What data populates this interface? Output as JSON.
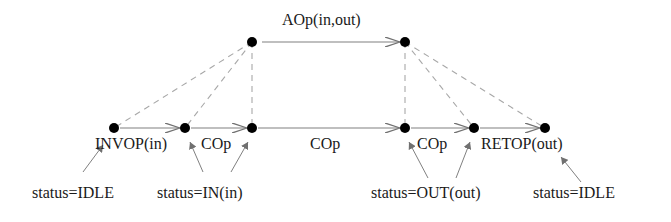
{
  "diagram": {
    "top_nodes": [
      {
        "id": "a1",
        "x": 252,
        "y": 42
      },
      {
        "id": "a2",
        "x": 405,
        "y": 42
      }
    ],
    "bottom_nodes": [
      {
        "id": "b1",
        "x": 114,
        "y": 128
      },
      {
        "id": "b2",
        "x": 185,
        "y": 128
      },
      {
        "id": "b3",
        "x": 252,
        "y": 128
      },
      {
        "id": "b4",
        "x": 405,
        "y": 128
      },
      {
        "id": "b5",
        "x": 474,
        "y": 128
      },
      {
        "id": "b6",
        "x": 545,
        "y": 128
      }
    ],
    "top_edge_label": "AOp(in,out)",
    "bottom_edge_labels": {
      "invop": "INVOP(in)",
      "cop1": "COp",
      "cop_mid": "COp",
      "cop2": "COp",
      "retop": "RETOP(out)"
    },
    "status_labels": {
      "idle_start": "status=IDLE",
      "in": "status=IN(in)",
      "out": "status=OUT(out)",
      "idle_end": "status=IDLE"
    },
    "colors": {
      "node": "#000000",
      "edge": "#808080",
      "dashed": "#a0a0a0"
    }
  }
}
